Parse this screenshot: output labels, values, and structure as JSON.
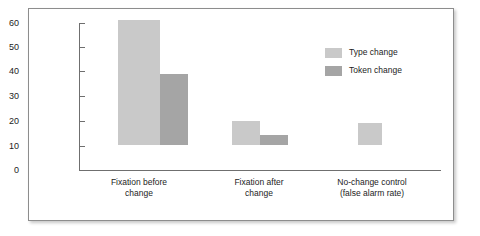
{
  "chart_data": {
    "type": "bar",
    "title": "",
    "xlabel": "",
    "ylabel": "",
    "ylim": [
      0,
      60
    ],
    "yticks": [
      0,
      10,
      20,
      30,
      40,
      50,
      60
    ],
    "ytick_labels": [
      "0",
      "10",
      "20",
      "30",
      "40",
      "50",
      "60"
    ],
    "grid": false,
    "legend_position": "upper right",
    "categories": [
      "Fixation before\nchange",
      "Fixation after\nchange",
      "No-change control\n(false alarm rate)"
    ],
    "series": [
      {
        "name": "Type change",
        "color": "#c9c9c9",
        "values": [
          51,
          10,
          9
        ]
      },
      {
        "name": "Token change",
        "color": "#a5a5a5",
        "values": [
          29,
          4,
          null
        ]
      }
    ]
  },
  "legend": {
    "items": [
      {
        "label": "Type change"
      },
      {
        "label": "Token change"
      }
    ]
  },
  "axes": {
    "y_labels": [
      "60",
      "50",
      "40",
      "30",
      "20",
      "10",
      "0"
    ]
  },
  "categories": {
    "labels": [
      "Fixation before\nchange",
      "Fixation after\nchange",
      "No-change control\n(false alarm rate)"
    ]
  }
}
